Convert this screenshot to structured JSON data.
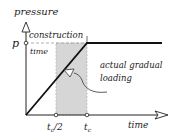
{
  "diagram": {
    "y_axis_label": "pressure",
    "x_axis_label": "time",
    "p_label": "p",
    "construction_label_line1": "construction",
    "construction_label_line2": "time",
    "annotation_line1": "actual gradual",
    "annotation_line2": "loading",
    "tick_half": "t",
    "tick_half_sub": "c",
    "tick_half_suffix": "/2",
    "tick_full": "t",
    "tick_full_sub": "c",
    "colors": {
      "line": "#111111",
      "shade": "#d6d6d6",
      "dashed": "#999999"
    }
  }
}
